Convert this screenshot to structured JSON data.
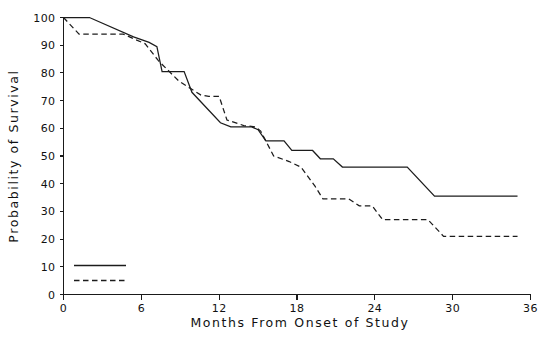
{
  "chart_data": {
    "type": "line",
    "title": "",
    "subtitle": "",
    "xlabel": "Months From Onset of Study",
    "ylabel": "Probability of Survival",
    "xlim": [
      0,
      36
    ],
    "ylim": [
      0,
      100
    ],
    "xticks": [
      0,
      6,
      12,
      18,
      24,
      30,
      36
    ],
    "xtick_labels": [
      "0",
      "6",
      "12",
      "18",
      "24",
      "30",
      "36"
    ],
    "yticks": [
      0,
      10,
      20,
      30,
      40,
      50,
      60,
      70,
      80,
      90,
      100
    ],
    "ytick_labels": [
      "0",
      "10",
      "20",
      "30",
      "40",
      "50",
      "60",
      "70",
      "80",
      "90",
      "100"
    ],
    "grid": false,
    "legend_position": "lower-left",
    "legend_entries": [
      {
        "name": "series-1",
        "label": "",
        "style": "solid"
      },
      {
        "name": "series-2",
        "label": "",
        "style": "dashed"
      }
    ],
    "annotations": [],
    "series": [
      {
        "name": "Group 1",
        "label": "",
        "style": "solid",
        "color": "#1c1c1c",
        "points": [
          [
            0.0,
            100.0
          ],
          [
            2.0,
            100.0
          ],
          [
            5.4,
            93.0
          ],
          [
            6.6,
            91.0
          ],
          [
            7.2,
            89.5
          ],
          [
            7.6,
            80.5
          ],
          [
            9.3,
            80.5
          ],
          [
            9.9,
            73.0
          ],
          [
            12.1,
            62.0
          ],
          [
            12.9,
            60.5
          ],
          [
            14.5,
            60.5
          ],
          [
            15.0,
            59.5
          ],
          [
            15.6,
            55.5
          ],
          [
            17.0,
            55.5
          ],
          [
            17.6,
            52.0
          ],
          [
            19.2,
            52.0
          ],
          [
            19.8,
            49.0
          ],
          [
            20.8,
            49.0
          ],
          [
            21.5,
            46.0
          ],
          [
            26.5,
            46.0
          ],
          [
            28.6,
            35.5
          ],
          [
            35.0,
            35.5
          ]
        ]
      },
      {
        "name": "Group 2",
        "label": "",
        "style": "dashed",
        "color": "#1c1c1c",
        "points": [
          [
            0.0,
            100.0
          ],
          [
            1.2,
            94.0
          ],
          [
            4.6,
            94.0
          ],
          [
            6.3,
            90.5
          ],
          [
            7.3,
            84.5
          ],
          [
            8.9,
            77.0
          ],
          [
            10.6,
            72.0
          ],
          [
            11.2,
            71.5
          ],
          [
            12.0,
            71.5
          ],
          [
            12.6,
            63.0
          ],
          [
            13.9,
            61.0
          ],
          [
            14.8,
            60.5
          ],
          [
            15.2,
            59.0
          ],
          [
            16.2,
            50.0
          ],
          [
            17.4,
            48.0
          ],
          [
            18.3,
            46.0
          ],
          [
            19.4,
            39.0
          ],
          [
            20.0,
            34.5
          ],
          [
            22.0,
            34.5
          ],
          [
            22.8,
            32.0
          ],
          [
            23.8,
            32.0
          ],
          [
            24.6,
            27.0
          ],
          [
            28.1,
            27.0
          ],
          [
            29.3,
            21.0
          ],
          [
            35.0,
            21.0
          ]
        ]
      }
    ]
  },
  "axis": {
    "y_title": "Probability of Survival",
    "x_title": "Months From Onset of Study"
  }
}
